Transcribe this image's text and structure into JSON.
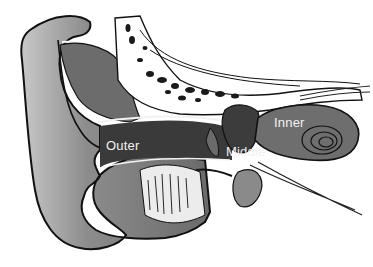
{
  "diagram": {
    "labels": {
      "outer": "Outer",
      "middle": "Middle",
      "inner": "Inner"
    },
    "colors": {
      "background": "#ffffff",
      "tissue": "#6e6e6e",
      "tissue_light": "#9a9a9a",
      "canal": "#2e2e2e",
      "outline": "#111111",
      "label_text": "#f2f2f2"
    }
  }
}
